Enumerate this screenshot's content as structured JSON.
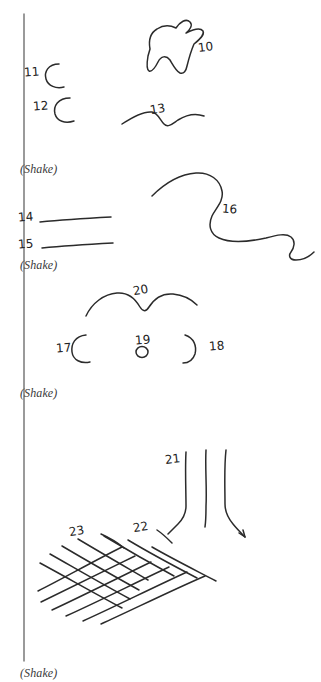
{
  "page": {
    "background_color": "#ffffff",
    "ink_color": "#2b2b2b",
    "width": 321,
    "height": 682,
    "margin_rule": {
      "name": "left-margin-rule",
      "x": 24,
      "y_start": 14,
      "y_end": 661,
      "color": "#6f6f6f"
    }
  },
  "captions": [
    {
      "id": "shake-1",
      "text": "(Shake)",
      "x": 20,
      "y": 163
    },
    {
      "id": "shake-2",
      "text": "(Shake)",
      "x": 20,
      "y": 259
    },
    {
      "id": "shake-3",
      "text": "(Shake)",
      "x": 20,
      "y": 387
    },
    {
      "id": "shake-4",
      "text": "(Shake)",
      "x": 20,
      "y": 667
    }
  ],
  "callouts": [
    {
      "id": "callout-10",
      "label": "10",
      "x": 198,
      "y": 41,
      "tilt": "tilt-a",
      "target": "irregular-blob-shape"
    },
    {
      "id": "callout-11",
      "label": "11",
      "x": 24,
      "y": 66,
      "tilt": "tilt-c",
      "target": "c-curve-upper"
    },
    {
      "id": "callout-12",
      "label": "12",
      "x": 33,
      "y": 100,
      "tilt": "tilt-c",
      "target": "c-curve-lower"
    },
    {
      "id": "callout-13",
      "label": "13",
      "x": 150,
      "y": 103,
      "tilt": "tilt-b",
      "target": "gentle-wave-line"
    },
    {
      "id": "callout-14",
      "label": "14",
      "x": 18,
      "y": 211,
      "tilt": "tilt-c",
      "target": "straight-line-upper"
    },
    {
      "id": "callout-15",
      "label": "15",
      "x": 18,
      "y": 238,
      "tilt": "tilt-c",
      "target": "straight-line-lower"
    },
    {
      "id": "callout-16",
      "label": "16",
      "x": 222,
      "y": 203,
      "tilt": "tilt-d",
      "target": "s-serpentine-curve"
    },
    {
      "id": "callout-17",
      "label": "17",
      "x": 56,
      "y": 342,
      "tilt": "tilt-c",
      "target": "left-bracket-curve"
    },
    {
      "id": "callout-18",
      "label": "18",
      "x": 209,
      "y": 340,
      "tilt": "tilt-c",
      "target": "right-bracket-curve"
    },
    {
      "id": "callout-19",
      "label": "19",
      "x": 135,
      "y": 334,
      "tilt": "tilt-c",
      "target": "small-circle"
    },
    {
      "id": "callout-20",
      "label": "20",
      "x": 133,
      "y": 284,
      "tilt": "tilt-b",
      "target": "double-hump-arc"
    },
    {
      "id": "callout-21",
      "label": "21",
      "x": 165,
      "y": 453,
      "tilt": "tilt-a",
      "target": "vertical-strand-group"
    },
    {
      "id": "callout-22",
      "label": "22",
      "x": 133,
      "y": 521,
      "tilt": "tilt-b",
      "target": "mesh-grid"
    },
    {
      "id": "callout-23",
      "label": "23",
      "x": 69,
      "y": 525,
      "tilt": "tilt-b",
      "target": "mesh-grid"
    }
  ],
  "drawings": [
    {
      "id": "irregular-blob-shape",
      "kind": "closed-freeform-blob",
      "panel": 1
    },
    {
      "id": "c-curve-upper",
      "kind": "open-c-arc",
      "panel": 1
    },
    {
      "id": "c-curve-lower",
      "kind": "open-c-arc",
      "panel": 1
    },
    {
      "id": "gentle-wave-line",
      "kind": "wavy-line",
      "panel": 1
    },
    {
      "id": "straight-line-upper",
      "kind": "straight-line",
      "panel": 2
    },
    {
      "id": "straight-line-lower",
      "kind": "straight-line",
      "panel": 2
    },
    {
      "id": "s-serpentine-curve",
      "kind": "serpentine-curve",
      "panel": 2
    },
    {
      "id": "double-hump-arc",
      "kind": "double-hump-arc",
      "panel": 3
    },
    {
      "id": "left-bracket-curve",
      "kind": "open-c-arc",
      "panel": 3
    },
    {
      "id": "right-bracket-curve",
      "kind": "reverse-c-arc",
      "panel": 3
    },
    {
      "id": "small-circle",
      "kind": "small-circle",
      "panel": 3
    },
    {
      "id": "vertical-strand-group",
      "kind": "three-vertical-strands",
      "panel": 4
    },
    {
      "id": "mesh-grid",
      "kind": "crosshatch-mesh",
      "panel": 4
    }
  ]
}
